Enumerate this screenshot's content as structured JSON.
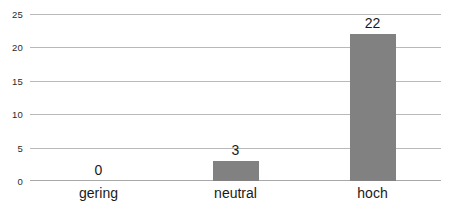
{
  "chart_data": {
    "type": "bar",
    "title": "",
    "subtitle": "",
    "xlabel": "",
    "ylabel": "",
    "categories": [
      "gering",
      "neutral",
      "hoch"
    ],
    "values": [
      0,
      3,
      22
    ],
    "data_labels": [
      "0",
      "3",
      "22"
    ],
    "ylim": [
      0,
      25
    ],
    "ytick_labels": [
      "0",
      "5",
      "10",
      "15",
      "20",
      "25"
    ],
    "ytick_values": [
      0,
      5,
      10,
      15,
      20,
      25
    ],
    "grid": "horizontal",
    "legend": "none",
    "series": [
      {
        "name": "",
        "values": [
          0,
          3,
          22
        ],
        "color": "#818181"
      }
    ],
    "colors": {
      "bar": "#818181",
      "gridline": "#b9b9b9",
      "axis_line": "#a8a8a8",
      "background": "#ffffff",
      "text": "#1a1a1a",
      "tick_text": "#2b2b2b"
    }
  }
}
